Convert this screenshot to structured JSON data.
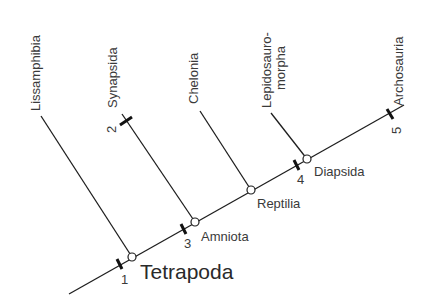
{
  "diagram": {
    "type": "cladogram",
    "root_label": "Tetrapoda",
    "taxa": [
      {
        "name": "Lissamphibia"
      },
      {
        "name": "Synapsida"
      },
      {
        "name": "Chelonia"
      },
      {
        "name_line1": "Lepidosauro-",
        "name_line2": "morpha"
      },
      {
        "name": "Archosauria"
      }
    ],
    "nodes": [
      {
        "name": "Tetrapoda"
      },
      {
        "name": "Amniota"
      },
      {
        "name": "Reptilia"
      },
      {
        "name": "Diapsida"
      }
    ],
    "synapomorphy_markers": [
      {
        "number": "1"
      },
      {
        "number": "2"
      },
      {
        "number": "3"
      },
      {
        "number": "4"
      },
      {
        "number": "5"
      }
    ],
    "colors": {
      "line": "#1e1e1e",
      "text": "#3a3a3a",
      "background": "#ffffff"
    }
  }
}
